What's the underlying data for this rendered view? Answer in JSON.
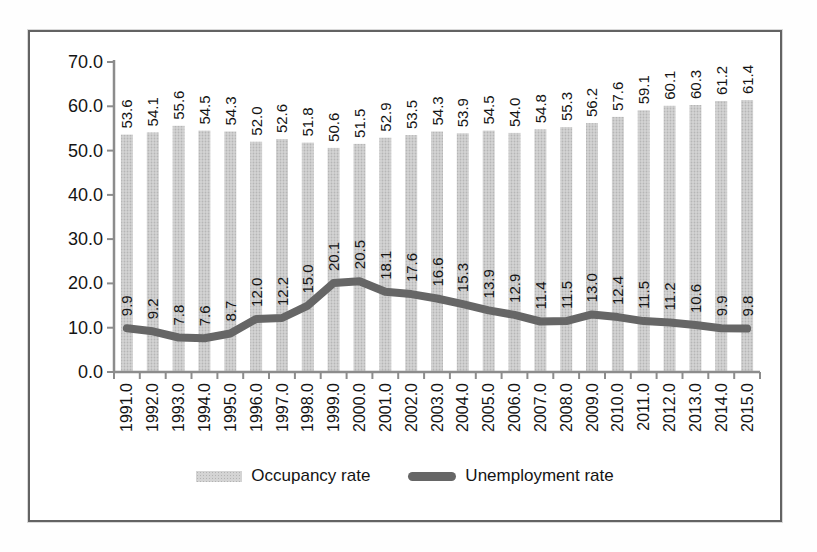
{
  "chart_data": {
    "type": "combo",
    "categories": [
      "1991.0",
      "1992.0",
      "1993.0",
      "1994.0",
      "1995.0",
      "1996.0",
      "1997.0",
      "1998.0",
      "1999.0",
      "2000.0",
      "2001.0",
      "2002.0",
      "2003.0",
      "2004.0",
      "2005.0",
      "2006.0",
      "2007.0",
      "2008.0",
      "2009.0",
      "2010.0",
      "2011.0",
      "2012.0",
      "2013.0",
      "2014.0",
      "2015.0"
    ],
    "series": [
      {
        "name": "Occupancy rate",
        "kind": "bar",
        "color": "#cccccc",
        "values": [
          53.6,
          54.1,
          55.6,
          54.5,
          54.3,
          52.0,
          52.6,
          51.8,
          50.6,
          51.5,
          52.9,
          53.5,
          54.3,
          53.9,
          54.5,
          54.0,
          54.8,
          55.3,
          56.2,
          57.6,
          59.1,
          60.1,
          60.3,
          61.2,
          61.4
        ]
      },
      {
        "name": "Unemployment rate",
        "kind": "line",
        "color": "#666666",
        "values": [
          9.9,
          9.2,
          7.8,
          7.6,
          8.7,
          12.0,
          12.2,
          15.0,
          20.1,
          20.5,
          18.1,
          17.6,
          16.6,
          15.3,
          13.9,
          12.9,
          11.4,
          11.5,
          13.0,
          12.4,
          11.5,
          11.2,
          10.6,
          9.9,
          9.8
        ]
      }
    ],
    "ylim": [
      0,
      70
    ],
    "ytick_labels": [
      "0.0",
      "10.0",
      "20.0",
      "30.0",
      "40.0",
      "50.0",
      "60.0",
      "70.0"
    ],
    "grid": false,
    "legend_position": "bottom",
    "value_labels": "rotated 90 degrees, one decimal",
    "axis_color": "#8c8c8c",
    "label_color": "#141414"
  }
}
